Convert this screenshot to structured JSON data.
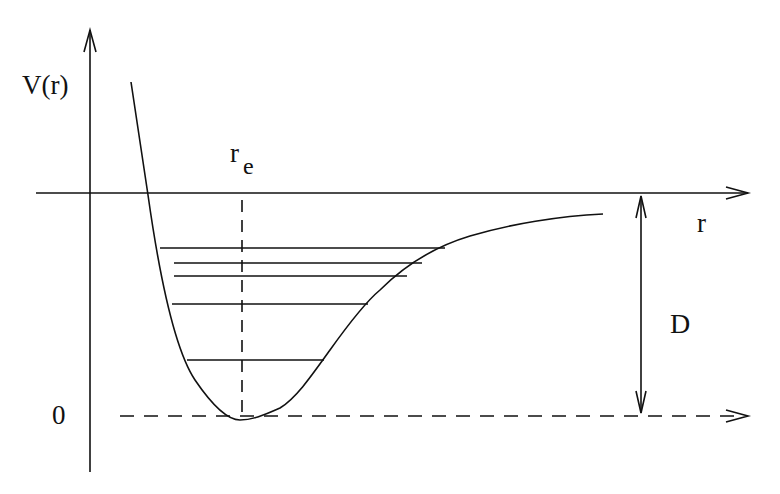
{
  "diagram": {
    "labels": {
      "y_axis": "V(r)",
      "x_axis": "r",
      "equilibrium": "r",
      "equilibrium_sub": "e",
      "dissociation": "D",
      "zero": "0"
    },
    "vibrational_levels": [
      {
        "y": 360,
        "x1": 187,
        "x2": 324
      },
      {
        "y": 304,
        "x1": 172,
        "x2": 368
      },
      {
        "y": 276,
        "x1": 174,
        "x2": 407
      },
      {
        "y": 263,
        "x1": 174,
        "x2": 422
      },
      {
        "y": 248,
        "x1": 160,
        "x2": 445
      }
    ],
    "colors": {
      "stroke": "#111111",
      "background": "#ffffff"
    }
  }
}
